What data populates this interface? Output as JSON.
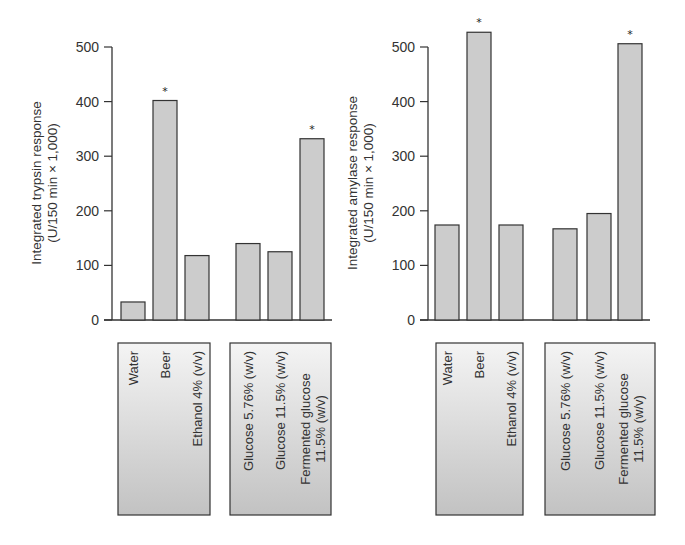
{
  "chart_data": [
    {
      "type": "bar",
      "title": "",
      "xlabel": "",
      "ylabel": "Integrated trypsin response",
      "ylabel_line2": "(U/150 min × 1,000)",
      "ylim": [
        0,
        500
      ],
      "yticks": [
        0,
        100,
        200,
        300,
        400,
        500
      ],
      "grid": false,
      "bar_color": "#cccccc",
      "groups": [
        {
          "categories": [
            "Water",
            "Beer",
            "Ethanol 4% (v/v)"
          ]
        },
        {
          "categories": [
            "Glucose 5.76% (w/v)",
            "Glucose 11.5% (w/v)",
            "Fermented glucose|11.5% (w/v)"
          ]
        }
      ],
      "categories": [
        "Water",
        "Beer",
        "Ethanol 4% (v/v)",
        "Glucose 5.76% (w/v)",
        "Glucose 11.5% (w/v)",
        "Fermented glucose 11.5% (w/v)"
      ],
      "values": [
        33,
        402,
        118,
        140,
        125,
        332
      ],
      "significant": [
        false,
        true,
        false,
        false,
        false,
        true
      ],
      "significance_marker": "*"
    },
    {
      "type": "bar",
      "title": "",
      "xlabel": "",
      "ylabel": "Integrated amylase response",
      "ylabel_line2": "(U/150 min × 1,000)",
      "ylim": [
        0,
        500
      ],
      "yticks": [
        0,
        100,
        200,
        300,
        400,
        500
      ],
      "grid": false,
      "bar_color": "#cccccc",
      "groups": [
        {
          "categories": [
            "Water",
            "Beer",
            "Ethanol 4% (v/v)"
          ]
        },
        {
          "categories": [
            "Glucose 5.76% (w/v)",
            "Glucose 11.5% (w/v)",
            "Fermented glucose|11.5% (w/v)"
          ]
        }
      ],
      "categories": [
        "Water",
        "Beer",
        "Ethanol 4% (v/v)",
        "Glucose 5.76% (w/v)",
        "Glucose 11.5% (w/v)",
        "Fermented glucose 11.5% (w/v)"
      ],
      "values": [
        174,
        527,
        174,
        167,
        195,
        506
      ],
      "significant": [
        false,
        true,
        false,
        false,
        false,
        true
      ],
      "significance_marker": "*"
    }
  ]
}
